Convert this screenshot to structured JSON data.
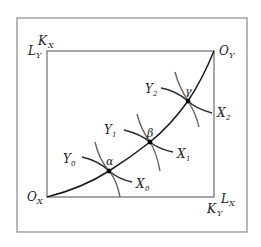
{
  "diagram": {
    "type": "edgeworth-box",
    "colors": {
      "frame": "#777777",
      "contract_curve": "#1a1a1a",
      "x_isoquant": "#2a2a2a",
      "y_isoquant": "#555555",
      "point": "#000000"
    },
    "corners": {
      "top_left": {
        "upper": {
          "base": "K",
          "sub": "X"
        },
        "lower": {
          "base": "L",
          "sub": "Y"
        }
      },
      "bottom_right": {
        "upper": {
          "base": "L",
          "sub": "X"
        },
        "lower": {
          "base": "K",
          "sub": "Y"
        }
      },
      "origin_x": {
        "base": "O",
        "sub": "X"
      },
      "origin_y": {
        "base": "O",
        "sub": "Y"
      }
    },
    "points": [
      {
        "name": "α",
        "x_label": {
          "base": "X",
          "sub": "0"
        },
        "y_label": {
          "base": "Y",
          "sub": "0"
        }
      },
      {
        "name": "β",
        "x_label": {
          "base": "X",
          "sub": "1"
        },
        "y_label": {
          "base": "Y",
          "sub": "1"
        }
      },
      {
        "name": "γ",
        "x_label": {
          "base": "X",
          "sub": "2"
        },
        "y_label": {
          "base": "Y",
          "sub": "2"
        }
      }
    ]
  }
}
